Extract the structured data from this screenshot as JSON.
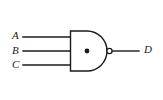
{
  "diagram": {
    "type": "logic-gate-schematic",
    "gate": {
      "name": "3-input NAND gate",
      "symbol_style": "distinctive-shape",
      "body_shape": "and-d-shape",
      "has_output_bubble": true,
      "center_dot": "•",
      "stroke_color": "#1a1a1a",
      "fill_color": "#ffffff",
      "background_color": "#ffffff"
    },
    "inputs": [
      {
        "label": "A",
        "wire": "input-wire-a"
      },
      {
        "label": "B",
        "wire": "input-wire-b"
      },
      {
        "label": "C",
        "wire": "input-wire-c"
      }
    ],
    "output": {
      "label": "D",
      "wire": "output-wire-d"
    }
  }
}
